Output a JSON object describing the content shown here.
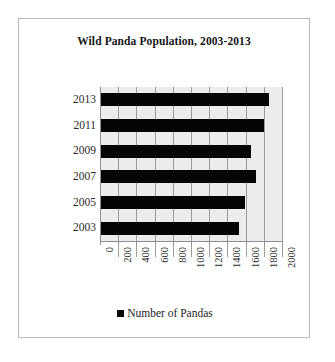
{
  "chart_data": {
    "type": "bar",
    "orientation": "horizontal",
    "title": "Wild Panda Population, 2003-2013",
    "categories": [
      "2013",
      "2011",
      "2009",
      "2007",
      "2005",
      "2003"
    ],
    "values": [
      1850,
      1790,
      1650,
      1700,
      1580,
      1520
    ],
    "series": [
      {
        "name": "Number of Pandas",
        "values": [
          1850,
          1790,
          1650,
          1700,
          1580,
          1520
        ],
        "color": "#050505"
      }
    ],
    "xlabel": "",
    "ylabel": "",
    "xlim": [
      0,
      2000
    ],
    "xticks": [
      "0",
      "200",
      "400",
      "600",
      "800",
      "1000",
      "1200",
      "1400",
      "1600",
      "1800",
      "2000"
    ],
    "xtick_values": [
      0,
      200,
      400,
      600,
      800,
      1000,
      1200,
      1400,
      1600,
      1800,
      2000
    ],
    "grid": true,
    "grid_axis": "x",
    "legend": {
      "position": "bottom",
      "entries": [
        {
          "label": "Number of Pandas",
          "color": "#050505",
          "marker": "square"
        }
      ]
    },
    "plot_background": "#ececed",
    "frame_border_color": "#b9bcbe"
  }
}
